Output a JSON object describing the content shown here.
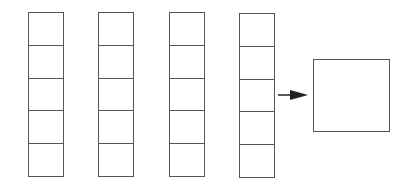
{
  "diagram": {
    "stroke_color": "#555555",
    "arrow_color": "#222222",
    "columns": [
      {
        "id": "column-1",
        "left": 28,
        "top": 12,
        "height": 165,
        "cells": 5
      },
      {
        "id": "column-2",
        "left": 98,
        "top": 12,
        "height": 165,
        "cells": 5
      },
      {
        "id": "column-3",
        "left": 169,
        "top": 12,
        "height": 165,
        "cells": 5
      },
      {
        "id": "column-4",
        "left": 239,
        "top": 13,
        "height": 165,
        "cells": 5
      }
    ],
    "arrow": {
      "from_x": 278,
      "to_x": 308,
      "y": 95,
      "direction": "right"
    },
    "output_box": {
      "left": 313,
      "top": 59,
      "width": 77,
      "height": 73
    }
  }
}
